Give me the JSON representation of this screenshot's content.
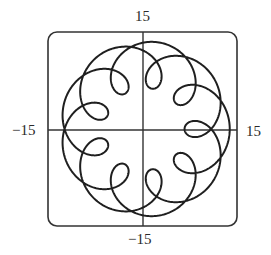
{
  "chart_data": {
    "type": "line",
    "subtype": "parametric",
    "title": "",
    "xlabel": "",
    "ylabel": "",
    "equation": {
      "x": "11 cos t - 4 cos(11t/2)",
      "y": "11 sin t - 4 sin(11t/2)",
      "t_range": [
        0,
        12.566
      ]
    },
    "params": {
      "A": 11,
      "B": 4,
      "k": 5.5,
      "t_min": 0,
      "t_max": 12.566370614359172,
      "samples": 1400
    },
    "xlim": [
      -15,
      15
    ],
    "ylim": [
      -15,
      15
    ],
    "tick_labels": {
      "top": "15",
      "bottom": "−15",
      "left": "−15",
      "right": "15"
    },
    "features": {
      "loop_count": 9,
      "loop_angles_deg": [
        0,
        40,
        80,
        120,
        160,
        200,
        240,
        280,
        320
      ],
      "max_radius": 15,
      "min_radius": 7
    },
    "grid": false,
    "legend": null,
    "frame": "rounded-rectangle",
    "colors": {
      "curve": "#1f1f1f",
      "axes": "#333333",
      "frame": "#333333",
      "background": "#ffffff"
    }
  }
}
